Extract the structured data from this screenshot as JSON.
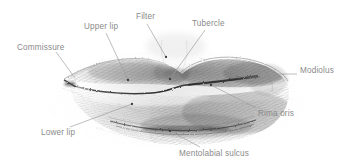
{
  "figure": {
    "medium": "graphite-sketch",
    "background_color": "#ffffff",
    "sketch_color": "#4a4a4a",
    "leader_line_color": "#9a9a9a",
    "label_text_color": "#8a8a8a"
  },
  "labels": [
    {
      "id": "commissure",
      "text": "Commissure",
      "leader": {
        "x1": 56,
        "y1": 52,
        "x2": 75,
        "y2": 78,
        "endpoint": "none"
      }
    },
    {
      "id": "upper-lip",
      "text": "Upper lip",
      "leader": {
        "x1": 106,
        "y1": 33,
        "x2": 128,
        "y2": 80,
        "endpoint": "dot"
      }
    },
    {
      "id": "filter",
      "text": "Filter",
      "leader": {
        "x1": 147,
        "y1": 24,
        "x2": 166,
        "y2": 57,
        "endpoint": "dot"
      }
    },
    {
      "id": "tubercle",
      "text": "Tubercle",
      "leader": {
        "x1": 205,
        "y1": 30,
        "x2": 170,
        "y2": 79,
        "endpoint": "dot"
      }
    },
    {
      "id": "modiolus",
      "text": "Modiolus",
      "leader": {
        "x1": 297,
        "y1": 74,
        "x2": 262,
        "y2": 74,
        "endpoint": "none"
      }
    },
    {
      "id": "rima-oris",
      "text": "Rima oris",
      "leader": {
        "x1": 256,
        "y1": 108,
        "x2": 211,
        "y2": 85,
        "endpoint": "dot"
      }
    },
    {
      "id": "lower-lip",
      "text": "Lower lip",
      "leader": {
        "x1": 70,
        "y1": 127,
        "x2": 132,
        "y2": 104,
        "endpoint": "dot"
      }
    },
    {
      "id": "mentolabial-sulcus",
      "text": "Mentolabial sulcus",
      "leader": {
        "x1": 200,
        "y1": 147,
        "x2": 170,
        "y2": 131,
        "endpoint": "dot"
      }
    }
  ]
}
